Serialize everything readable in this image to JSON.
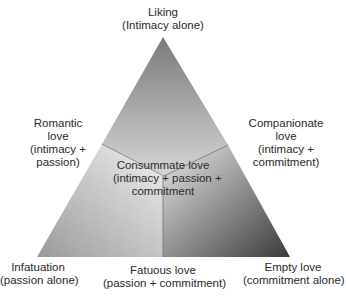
{
  "diagram": {
    "type": "triangular theory of love",
    "vertices": {
      "top": {
        "title": "Liking",
        "subtitle": "(Intimacy alone)"
      },
      "bottom_left": {
        "title": "Infatuation",
        "subtitle": "(passion alone)"
      },
      "bottom_right": {
        "title": "Empty love",
        "subtitle": "(commitment alone)"
      }
    },
    "edges": {
      "left": {
        "line1": "Romantic",
        "line2": "love",
        "line3": "(intimacy +",
        "line4": "passion)"
      },
      "right": {
        "line1": "Companionate",
        "line2": "love",
        "line3": "(intimacy +",
        "line4": "commitment)"
      },
      "bottom": {
        "title": "Fatuous love",
        "subtitle": "(passion + commitment)"
      }
    },
    "center": {
      "line1": "Consummate love",
      "line2": "(intimacy + passion +",
      "line3": "commitment"
    },
    "colors": {
      "apex": "#7a7a7a",
      "light": "#f0f0f0",
      "dark": "#3a3a3a",
      "left_base": "#9a9a9a"
    }
  }
}
